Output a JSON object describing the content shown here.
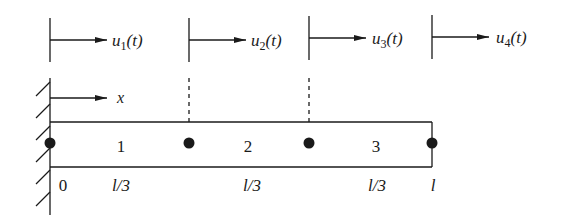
{
  "diagram": {
    "type": "finite-element bar with three elements",
    "colors": {
      "ink": "#1a1a1a",
      "background": "#ffffff"
    },
    "displacements": [
      {
        "symbol": "u",
        "subscript": "1",
        "arg": "(t)"
      },
      {
        "symbol": "u",
        "subscript": "2",
        "arg": "(t)"
      },
      {
        "symbol": "u",
        "subscript": "3",
        "arg": "(t)"
      },
      {
        "symbol": "u",
        "subscript": "4",
        "arg": "(t)"
      }
    ],
    "axis": {
      "label": "x"
    },
    "elements": [
      {
        "label": "1",
        "length": "l/3"
      },
      {
        "label": "2",
        "length": "l/3"
      },
      {
        "label": "3",
        "length": "l/3"
      }
    ],
    "coordinates": {
      "start": "0",
      "end": "l"
    },
    "support": "fixed-wall"
  }
}
